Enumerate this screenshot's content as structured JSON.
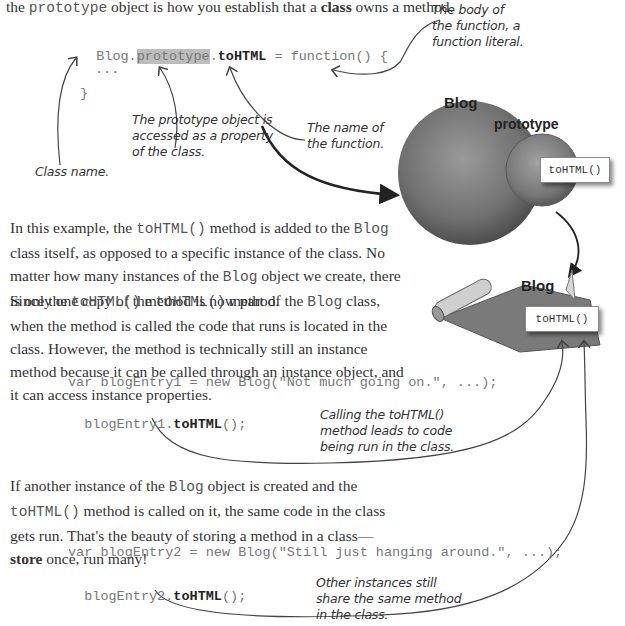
{
  "intro_line": {
    "prefix": "the ",
    "code": "prototype",
    "middle": " object is how you establish that a ",
    "bold": "class",
    "suffix": " owns a method."
  },
  "code_block_1": {
    "line1_class": "Blog",
    "line1_dot1": ".",
    "line1_prototype": "prototype",
    "line1_dot2": ".",
    "line1_method": "toHTML",
    "line1_rest": " = function() {",
    "line2": "...",
    "line3": "}"
  },
  "annotations": {
    "class_name": "Class name.",
    "prototype_object": [
      "The prototype object is",
      "accessed as a property",
      "of the class."
    ],
    "function_name": [
      "The name of",
      "the function."
    ],
    "function_body": [
      "The body of",
      "the function, a",
      "function literal."
    ],
    "calling_method": [
      "Calling the toHTML()",
      "method leads to code",
      "being run in the class."
    ],
    "other_instances": [
      "Other instances still",
      "share the same method",
      "in the class."
    ]
  },
  "diagram": {
    "top_label": "Blog",
    "prototype_label": "prototype",
    "method_box_top": "toHTML()",
    "bottom_label": "Blog",
    "method_box_bottom": "toHTML()",
    "colors": {
      "sphere": "#6e6e6e",
      "sphere_light": "#9a9a9a",
      "paper": "#8a8a8a"
    }
  },
  "paragraph_1": {
    "t1": "In this example, the ",
    "c1": "toHTML()",
    "t2": " method is added to the ",
    "c2": "Blog",
    "t3": " class itself, as opposed to a specific instance of the class. No matter how many instances of the ",
    "c3": "Blog",
    "t4": " object we create, there is only one copy of the ",
    "c4": "toHTML()",
    "t5": " method."
  },
  "paragraph_2": {
    "t1": "Since the ",
    "c1": "toHTML()",
    "t2": " method is now part of the ",
    "c2": "Blog",
    "t3": " class, when the method is called the code that runs is located in the class. However, the method is technically still an instance method because it can be called through an instance object, and it can access instance properties."
  },
  "code_block_2": {
    "line1": "var blogEntry1 = new Blog(\"Not much going on.\", ...);",
    "line2_obj": "blogEntry1.",
    "line2_method": "toHTML",
    "line2_rest": "();"
  },
  "paragraph_3": {
    "t1": "If another instance of the ",
    "c1": "Blog",
    "t2": " object is created and the ",
    "c2": "toHTML()",
    "t3": " method is called on it, the same code in the class gets run. That's the beauty of storing a method in a class—",
    "bold": "store",
    "t4": " once, run many!"
  },
  "code_block_3": {
    "line1": "var blogEntry2 = new Blog(\"Still just hanging around.\", ...);",
    "line2_obj": "blogEntry2.",
    "line2_method": "toHTML",
    "line2_rest": "();"
  }
}
